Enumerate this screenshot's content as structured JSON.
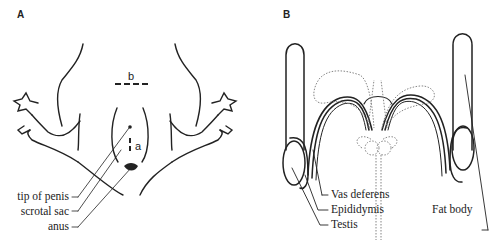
{
  "panels": [
    {
      "id": "A",
      "letter": "A",
      "dimension_labels": {
        "vertical": "a",
        "horizontal": "b"
      },
      "labels": [
        "tip of penis",
        "scrotal sac",
        "anus"
      ]
    },
    {
      "id": "B",
      "letter": "B",
      "labels": [
        "Vas deferens",
        "Epididymis",
        "Testis",
        "Fat body"
      ]
    }
  ]
}
